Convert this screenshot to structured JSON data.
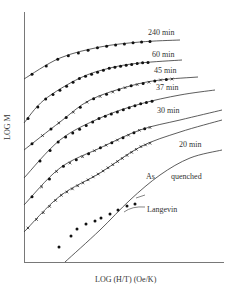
{
  "chart_data": {
    "type": "line",
    "title": "",
    "xlabel": "LOG (H/T) (Oe/K)",
    "ylabel": "LOG M",
    "grid": false,
    "legend_position": "inline labels at right end of curves",
    "axes_px": {
      "x0": 24,
      "y0": 262,
      "x1": 224,
      "ytop": 12
    },
    "note": "No numeric ticks shown; coordinates are relative plot positions (x: 0-100 left→right, y: 0-100 bottom→top).",
    "series": [
      {
        "name": "240 min",
        "label": "240 min",
        "style": "solid line with filled circles",
        "curve": [
          [
            0,
            73.2
          ],
          [
            18,
            81.6
          ],
          [
            38,
            86
          ],
          [
            58,
            88
          ],
          [
            78,
            88.8
          ]
        ],
        "markers": "filled-circle"
      },
      {
        "name": "60 min",
        "label": "60 min",
        "style": "solid line with filled circles",
        "curve": [
          [
            0,
            55.6
          ],
          [
            10,
            64.8
          ],
          [
            28,
            73.6
          ],
          [
            43,
            77.6
          ],
          [
            58,
            79.6
          ],
          [
            79,
            80.8
          ]
        ],
        "markers": "filled-circle"
      },
      {
        "name": "45 min",
        "label": "45 min",
        "style": "solid line with filled circles and crosses",
        "curve": [
          [
            0,
            44.8
          ],
          [
            18,
            56
          ],
          [
            33,
            64.8
          ],
          [
            53,
            70.4
          ],
          [
            68,
            72.8
          ],
          [
            87,
            74
          ]
        ],
        "markers": "filled-circle/cross"
      },
      {
        "name": "37 min",
        "label": "37 min",
        "style": "solid line with filled circles",
        "curve": [
          [
            0,
            33.6
          ],
          [
            18,
            48.8
          ],
          [
            38,
            57.6
          ],
          [
            58,
            63.2
          ],
          [
            78,
            66.8
          ],
          [
            95.5,
            68.8
          ]
        ],
        "markers": "filled-circle"
      },
      {
        "name": "30 min",
        "label": "30 min",
        "style": "solid line with filled circles and crosses",
        "curve": [
          [
            0,
            22.8
          ],
          [
            18,
            37.6
          ],
          [
            38,
            45.6
          ],
          [
            58,
            52.8
          ],
          [
            78,
            56.8
          ],
          [
            99,
            60.8
          ]
        ],
        "markers": "filled-circle/cross"
      },
      {
        "name": "20 min",
        "label": "20 min",
        "style": "solid line with crosses",
        "curve": [
          [
            0,
            12
          ],
          [
            18,
            26.4
          ],
          [
            38,
            35.6
          ],
          [
            58,
            46
          ],
          [
            78,
            52
          ],
          [
            99,
            56.8
          ]
        ],
        "markers": "cross"
      },
      {
        "name": "As quenched",
        "label": "As quenched",
        "style": "filled circles only (no line)",
        "points": [
          [
            17.5,
            6
          ],
          [
            23.5,
            10.4
          ],
          [
            26.5,
            13.2
          ],
          [
            31,
            15.2
          ],
          [
            35.5,
            16.4
          ],
          [
            38.5,
            17.6
          ],
          [
            43,
            19.2
          ],
          [
            47,
            20.8
          ],
          [
            51.5,
            22.4
          ],
          [
            55.5,
            23.2
          ]
        ],
        "markers": "filled-circle"
      },
      {
        "name": "Langevin",
        "label": "Langevin",
        "style": "solid line, theoretical",
        "curve": [
          [
            20.5,
            0
          ],
          [
            38,
            12.8
          ],
          [
            53,
            24.8
          ],
          [
            68,
            34.8
          ],
          [
            83,
            41.6
          ],
          [
            99,
            44.8
          ]
        ],
        "markers": "none"
      }
    ]
  },
  "labels": {
    "s240": "240 min",
    "s60": "60 min",
    "s45": "45 min",
    "s37": "37 min",
    "s30": "30 min",
    "s20": "20 min",
    "as": "As",
    "quenched": "quenched",
    "langevin": "Langevin",
    "xlabel": "LOG (H/T) (Oe/K)",
    "ylabel": "LOG M"
  }
}
